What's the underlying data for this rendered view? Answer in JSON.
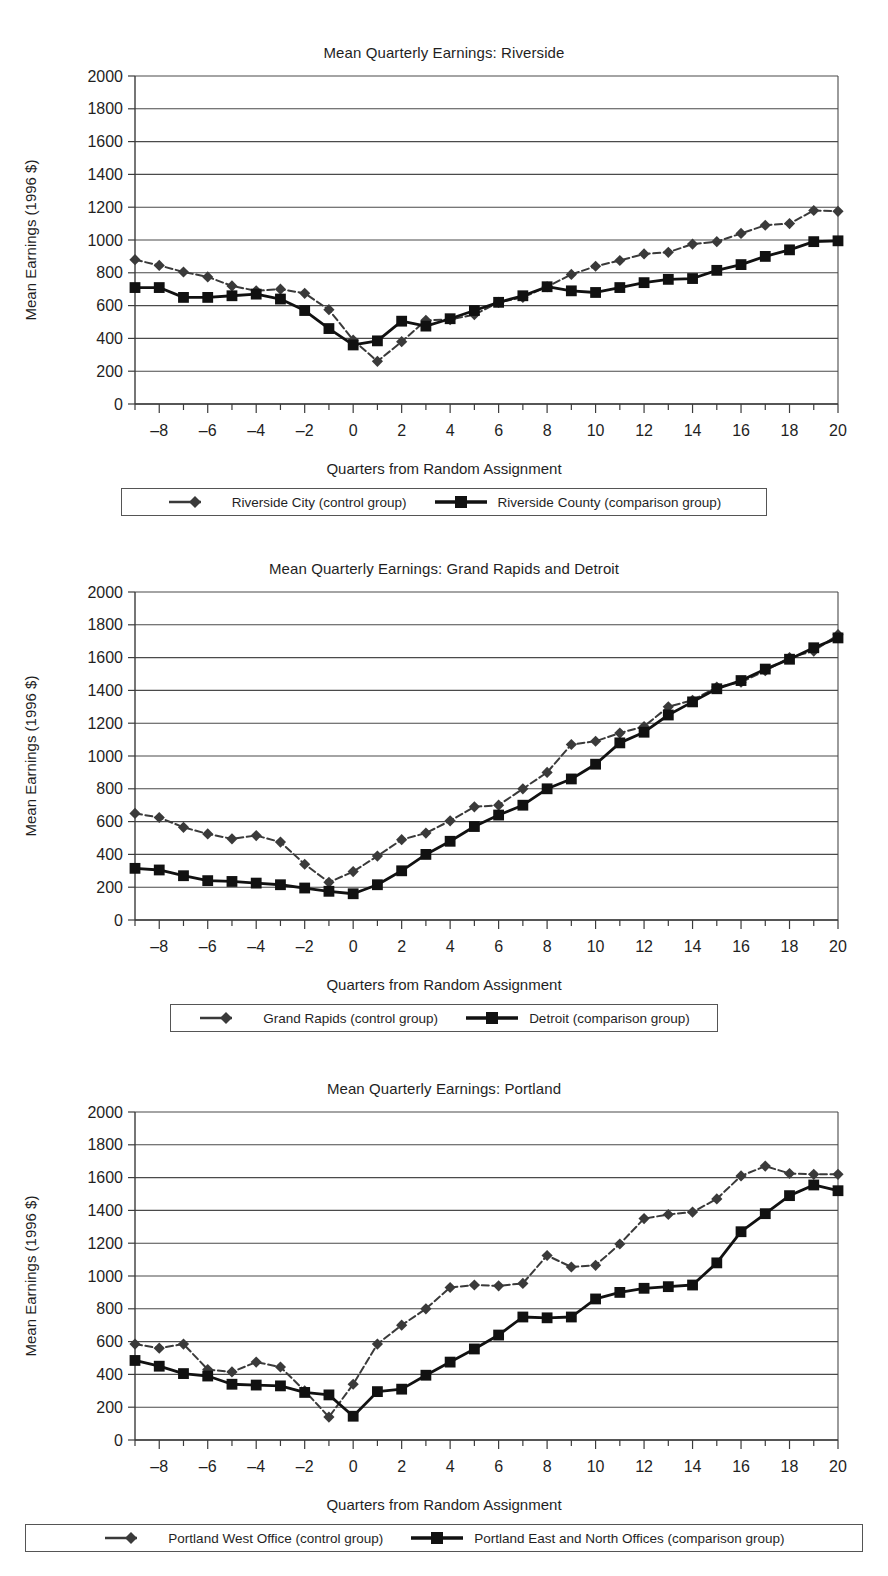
{
  "axis": {
    "y_ticks": [
      0,
      200,
      400,
      600,
      800,
      1000,
      1200,
      1400,
      1600,
      1800,
      2000
    ],
    "x_ticks": [
      -8,
      -6,
      -4,
      -2,
      0,
      2,
      4,
      6,
      8,
      10,
      12,
      14,
      16,
      18,
      20
    ],
    "ylabel": "Mean Earnings (1996 $)",
    "xlabel": "Quarters from Random Assignment"
  },
  "colors": {
    "series_control": "#3a3a3a",
    "series_comparison": "#111111",
    "gridline": "#4a4a4a",
    "axis": "#3c3c3c",
    "text": "#1f1f1f"
  },
  "charts": [
    {
      "id": "riverside",
      "title": "Mean Quarterly Earnings: Riverside",
      "legend": [
        {
          "label": "Riverside City (control group)",
          "marker": "diamond",
          "dash": true
        },
        {
          "label": "Riverside County (comparison group)",
          "marker": "square",
          "dash": false
        }
      ]
    },
    {
      "id": "grand-rapids-detroit",
      "title": "Mean Quarterly Earnings:  Grand Rapids and Detroit",
      "legend": [
        {
          "label": "Grand Rapids (control group)",
          "marker": "diamond",
          "dash": true
        },
        {
          "label": "Detroit (comparison group)",
          "marker": "square",
          "dash": false
        }
      ]
    },
    {
      "id": "portland",
      "title": "Mean Quarterly Earnings: Portland",
      "legend": [
        {
          "label": "Portland West Office (control group)",
          "marker": "diamond",
          "dash": true
        },
        {
          "label": "Portland East and North Offices (comparison group)",
          "marker": "square",
          "dash": false
        }
      ]
    }
  ],
  "chart_data": [
    {
      "type": "line",
      "title": "Mean Quarterly Earnings: Riverside",
      "xlabel": "Quarters from Random Assignment",
      "ylabel": "Mean Earnings (1996 $)",
      "xlim": [
        -9,
        20
      ],
      "ylim": [
        0,
        2000
      ],
      "grid": true,
      "legend_position": "bottom",
      "x": [
        -9,
        -8,
        -7,
        -6,
        -5,
        -4,
        -3,
        -2,
        -1,
        0,
        1,
        2,
        3,
        4,
        5,
        6,
        7,
        8,
        9,
        10,
        11,
        12,
        13,
        14,
        15,
        16,
        17,
        18,
        19,
        20
      ],
      "series": [
        {
          "name": "Riverside City (control group)",
          "marker": "diamond",
          "dash": true,
          "values": [
            880,
            845,
            805,
            775,
            720,
            690,
            700,
            675,
            575,
            390,
            260,
            380,
            510,
            515,
            545,
            620,
            650,
            715,
            790,
            840,
            875,
            915,
            925,
            975,
            990,
            1040,
            1090,
            1100,
            1180,
            1175,
            1205
          ]
        },
        {
          "name": "Riverside County (comparison group)",
          "marker": "square",
          "dash": false,
          "values": [
            710,
            710,
            650,
            650,
            660,
            670,
            640,
            570,
            460,
            360,
            385,
            505,
            475,
            520,
            570,
            620,
            660,
            715,
            690,
            680,
            710,
            740,
            760,
            765,
            815,
            850,
            900,
            940,
            990,
            995,
            1100
          ]
        }
      ]
    },
    {
      "type": "line",
      "title": "Mean Quarterly Earnings:  Grand Rapids and Detroit",
      "xlabel": "Quarters from Random Assignment",
      "ylabel": "Mean Earnings (1996 $)",
      "xlim": [
        -9,
        20
      ],
      "ylim": [
        0,
        2000
      ],
      "grid": true,
      "legend_position": "bottom",
      "x": [
        -9,
        -8,
        -7,
        -6,
        -5,
        -4,
        -3,
        -2,
        -1,
        0,
        1,
        2,
        3,
        4,
        5,
        6,
        7,
        8,
        9,
        10,
        11,
        12,
        13,
        14,
        15,
        16,
        17,
        18,
        19,
        20
      ],
      "series": [
        {
          "name": "Grand Rapids (control group)",
          "marker": "diamond",
          "dash": true,
          "values": [
            650,
            625,
            565,
            525,
            495,
            515,
            475,
            340,
            230,
            295,
            390,
            490,
            530,
            605,
            690,
            700,
            800,
            900,
            1070,
            1090,
            1140,
            1180,
            1300,
            1340,
            1420,
            1450,
            1520,
            1600,
            1640,
            1740,
            1790
          ]
        },
        {
          "name": "Detroit (comparison group)",
          "marker": "square",
          "dash": false,
          "values": [
            315,
            305,
            270,
            240,
            235,
            225,
            215,
            195,
            175,
            160,
            215,
            300,
            400,
            480,
            570,
            640,
            700,
            800,
            860,
            950,
            1080,
            1145,
            1250,
            1330,
            1410,
            1460,
            1530,
            1590,
            1660,
            1720,
            1800
          ]
        }
      ]
    },
    {
      "type": "line",
      "title": "Mean Quarterly Earnings: Portland",
      "xlabel": "Quarters from Random Assignment",
      "ylabel": "Mean Earnings (1996 $)",
      "xlim": [
        -9,
        20
      ],
      "ylim": [
        0,
        2000
      ],
      "grid": true,
      "legend_position": "bottom",
      "x": [
        -9,
        -8,
        -7,
        -6,
        -5,
        -4,
        -3,
        -2,
        -1,
        0,
        1,
        2,
        3,
        4,
        5,
        6,
        7,
        8,
        9,
        10,
        11,
        12,
        13,
        14,
        15,
        16,
        17,
        18,
        19,
        20
      ],
      "series": [
        {
          "name": "Portland West Office (control group)",
          "marker": "diamond",
          "dash": true,
          "values": [
            585,
            560,
            585,
            430,
            415,
            475,
            445,
            300,
            140,
            340,
            585,
            700,
            800,
            930,
            945,
            940,
            955,
            1125,
            1055,
            1065,
            1195,
            1350,
            1375,
            1390,
            1470,
            1610,
            1670,
            1625,
            1620,
            1620
          ]
        },
        {
          "name": "Portland East and North Offices (comparison group)",
          "marker": "square",
          "dash": false,
          "values": [
            485,
            450,
            405,
            390,
            340,
            335,
            330,
            290,
            275,
            145,
            295,
            310,
            395,
            475,
            555,
            640,
            750,
            745,
            750,
            860,
            900,
            925,
            935,
            945,
            1080,
            1270,
            1380,
            1490,
            1555,
            1520,
            1500
          ]
        }
      ]
    }
  ]
}
